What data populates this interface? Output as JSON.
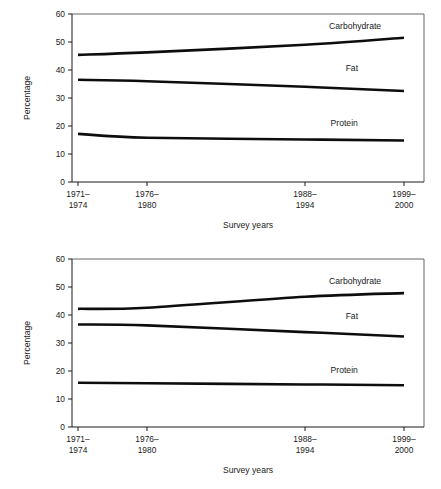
{
  "chart_data": [
    {
      "id": "top",
      "type": "line",
      "title": "",
      "xlabel": "Survey years",
      "ylabel": "Percentage",
      "ylim": [
        0,
        60
      ],
      "yticks": [
        0,
        10,
        20,
        30,
        40,
        50,
        60
      ],
      "ytick_labels": [
        "0",
        "10",
        "20",
        "30",
        "40",
        "50",
        "60"
      ],
      "grid": false,
      "legend_position": "inline-above-line",
      "categories": [
        "1971–\n1974",
        "1976–\n1980",
        "1988–\n1994",
        "1999–\n2000"
      ],
      "xtick_labels": [
        {
          "line1": "1971–",
          "line2": "1974"
        },
        {
          "line1": "1976–",
          "line2": "1980"
        },
        {
          "line1": "1988–",
          "line2": "1994"
        },
        {
          "line1": "1999–",
          "line2": "2000"
        }
      ],
      "series": [
        {
          "name": "Carbohydrate",
          "values": [
            45.4,
            46.3,
            49.0,
            51.5
          ],
          "label_x_index": 2.55,
          "label_y": 54.5
        },
        {
          "name": "Fat",
          "values": [
            36.5,
            36.0,
            34.0,
            32.5
          ],
          "label_x_index": 2.52,
          "label_y": 39.5
        },
        {
          "name": "Protein",
          "values": [
            17.2,
            15.8,
            15.2,
            14.8
          ],
          "label_x_index": 2.45,
          "label_y": 20.0
        }
      ]
    },
    {
      "id": "bottom",
      "type": "line",
      "title": "",
      "xlabel": "Survey years",
      "ylabel": "Percentage",
      "ylim": [
        0,
        60
      ],
      "yticks": [
        0,
        10,
        20,
        30,
        40,
        50,
        60
      ],
      "ytick_labels": [
        "0",
        "10",
        "20",
        "30",
        "40",
        "50",
        "60"
      ],
      "grid": false,
      "legend_position": "inline-above-line",
      "categories": [
        "1971–\n1974",
        "1976–\n1980",
        "1988–\n1994",
        "1999–\n2000"
      ],
      "xtick_labels": [
        {
          "line1": "1971–",
          "line2": "1974"
        },
        {
          "line1": "1976–",
          "line2": "1980"
        },
        {
          "line1": "1988–",
          "line2": "1994"
        },
        {
          "line1": "1999–",
          "line2": "2000"
        }
      ],
      "series": [
        {
          "name": "Carbohydrate",
          "values": [
            42.2,
            42.6,
            46.5,
            47.8
          ],
          "label_x_index": 2.55,
          "label_y": 51.0
        },
        {
          "name": "Fat",
          "values": [
            36.6,
            36.3,
            33.9,
            32.3
          ],
          "label_x_index": 2.52,
          "label_y": 38.6
        },
        {
          "name": "Protein",
          "values": [
            15.8,
            15.6,
            15.2,
            14.9
          ],
          "label_x_index": 2.45,
          "label_y": 19.4
        }
      ]
    }
  ],
  "colors": {
    "line": "#0d0d0d",
    "axis": "#1a1a1a",
    "frame": "#555555",
    "background": "#ffffff"
  }
}
